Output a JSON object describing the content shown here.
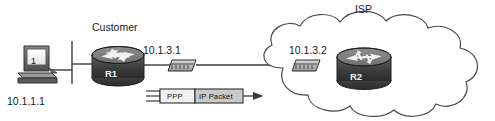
{
  "diagram": {
    "type": "network-topology",
    "background_color": "#ffffff",
    "line_color": "#3b3b3b",
    "labels": {
      "customer": "Customer",
      "isp": "ISP",
      "host_ip": "10.1.1.1",
      "r1_serial_ip": "10.1.3.1",
      "r2_serial_ip": "10.1.3.2",
      "router1_name": "R1",
      "router2_name": "R2",
      "host_number": "1"
    },
    "frame": {
      "ppp_header_label": "PPP",
      "payload_label": "IP Packet"
    },
    "nodes": [
      {
        "id": "pc1",
        "kind": "workstation-icon",
        "label": "10.1.1.1"
      },
      {
        "id": "r1",
        "kind": "router-icon",
        "label": "R1"
      },
      {
        "id": "dsu1",
        "kind": "csu-dsu-icon",
        "label": "10.1.3.1"
      },
      {
        "id": "dsu2",
        "kind": "csu-dsu-icon",
        "label": "10.1.3.2"
      },
      {
        "id": "r2",
        "kind": "router-icon",
        "label": "R2"
      },
      {
        "id": "cloud",
        "kind": "wan-cloud-icon",
        "label": "ISP"
      }
    ]
  }
}
